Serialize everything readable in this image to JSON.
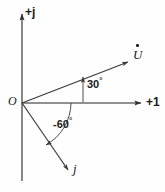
{
  "figure": {
    "kind": "phasor-diagram",
    "background_color": "#fefefe",
    "stroke_color": "#3a3a3a",
    "text_color": "#1a1a1a"
  },
  "axes": {
    "imaginary": {
      "label": "+j",
      "orientation": "vertical",
      "arrow_at": "top"
    },
    "real": {
      "label": "+1",
      "orientation": "horizontal",
      "arrow_at": "right"
    },
    "origin": {
      "label": "O"
    }
  },
  "vectors": [
    {
      "name": "phasor-u",
      "label": "U",
      "accent": "dot",
      "angle_deg": 30,
      "angle_label": "30",
      "degree_symbol": "°"
    },
    {
      "name": "unit-j",
      "label": "j",
      "angle_deg": -60,
      "angle_label": "-60",
      "degree_symbol": "°"
    }
  ],
  "annotations": {
    "angle_30": "30",
    "angle_60": "-60",
    "degree_symbol": "°"
  }
}
